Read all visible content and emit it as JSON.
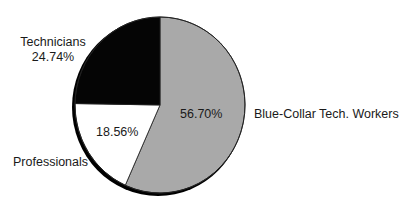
{
  "chart_data": {
    "type": "pie",
    "title": "",
    "start_angle_deg": 0,
    "direction": "clockwise",
    "slices": [
      {
        "label": "Blue-Collar Tech. Workers",
        "value": 56.7,
        "value_label": "56.70%",
        "color": "#a9a9a9"
      },
      {
        "label": "Professionals",
        "value": 18.56,
        "value_label": "18.56%",
        "color": "#ffffff"
      },
      {
        "label": "Technicians",
        "value": 24.74,
        "value_label": "24.74%",
        "color": "#050505"
      }
    ],
    "legend": "none (labels placed beside slices)"
  },
  "labels": {
    "technicians_name": "Technicians",
    "technicians_pct": "24.74%",
    "blue_collar_name": "Blue-Collar Tech. Workers",
    "blue_collar_pct": "56.70%",
    "professionals_name": "Professionals",
    "professionals_pct": "18.56%"
  }
}
